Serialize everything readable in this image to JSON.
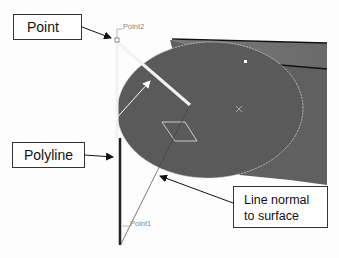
{
  "callouts": {
    "point": "Point",
    "polyline": "Polyline",
    "normal_line1": "Line normal",
    "normal_line2": "to surface"
  },
  "labels": {
    "point2": "Point2",
    "point1": "Point1"
  },
  "colors": {
    "surface": "#5a5a5a",
    "surface_top": "#6e6e6e",
    "polyline_segment": "#f2f2f2",
    "normal_line": "#222222",
    "callout_border": "#333333"
  }
}
